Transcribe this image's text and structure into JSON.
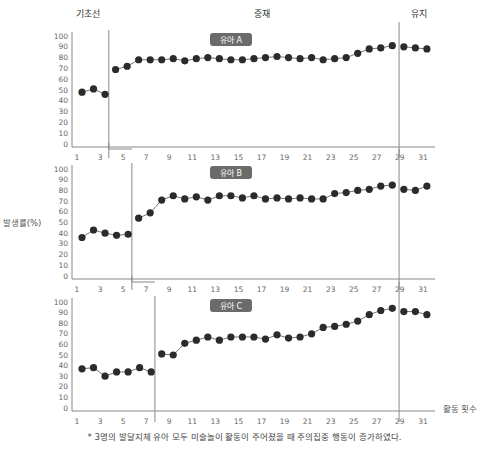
{
  "chart_data": {
    "type": "line",
    "title": "",
    "xlabel": "활동 횟수",
    "ylabel": "발생률(%)",
    "ylim": [
      0,
      100
    ],
    "yticks": [
      0,
      10,
      20,
      30,
      40,
      50,
      60,
      70,
      80,
      90,
      100
    ],
    "xticks": [
      1,
      3,
      5,
      7,
      9,
      11,
      13,
      15,
      17,
      19,
      21,
      23,
      25,
      27,
      29,
      31
    ],
    "phases": [
      "기초선",
      "중재",
      "유지"
    ],
    "grid": false,
    "panels": [
      {
        "name": "유아 A",
        "baseline_end": 3,
        "maintenance_start": 29,
        "x": [
          1,
          2,
          3,
          4,
          5,
          6,
          7,
          8,
          9,
          10,
          11,
          12,
          13,
          14,
          15,
          16,
          17,
          18,
          19,
          20,
          21,
          22,
          23,
          24,
          25,
          26,
          27,
          28,
          29,
          30,
          31
        ],
        "values": [
          48,
          51,
          46,
          69,
          72,
          78,
          78,
          78,
          79,
          77,
          79,
          80,
          79,
          78,
          78,
          79,
          80,
          81,
          80,
          79,
          80,
          78,
          79,
          80,
          84,
          88,
          89,
          91,
          90,
          89,
          88
        ]
      },
      {
        "name": "유아 B",
        "baseline_end": 5,
        "maintenance_start": 29,
        "x": [
          1,
          2,
          3,
          4,
          5,
          6,
          7,
          8,
          9,
          10,
          11,
          12,
          13,
          14,
          15,
          16,
          17,
          18,
          19,
          20,
          21,
          22,
          23,
          24,
          25,
          26,
          27,
          28,
          29,
          30,
          31
        ],
        "values": [
          36,
          43,
          40,
          38,
          39,
          54,
          59,
          71,
          75,
          72,
          74,
          71,
          75,
          75,
          73,
          75,
          72,
          73,
          72,
          73,
          72,
          72,
          77,
          78,
          80,
          81,
          84,
          85,
          81,
          80,
          84
        ]
      },
      {
        "name": "유아 C",
        "baseline_end": 7,
        "maintenance_start": 29,
        "x": [
          1,
          2,
          3,
          4,
          5,
          6,
          7,
          8,
          9,
          10,
          11,
          12,
          13,
          14,
          15,
          16,
          17,
          18,
          19,
          20,
          21,
          22,
          23,
          24,
          25,
          26,
          27,
          28,
          29,
          30,
          31
        ],
        "values": [
          37,
          38,
          30,
          34,
          34,
          38,
          34,
          51,
          50,
          61,
          64,
          67,
          64,
          67,
          67,
          67,
          65,
          69,
          66,
          67,
          70,
          76,
          77,
          79,
          82,
          88,
          92,
          94,
          91,
          91,
          88
        ]
      }
    ],
    "note": "* 3명의 발달지체 유아 모두 미술놀이 활동이 주어졌을 때 주의집중 행동이 증가하였다."
  },
  "colors": {
    "point": "#2b2b2b",
    "line": "#666666",
    "axis": "#888888",
    "badge": "#6b6b6b"
  }
}
